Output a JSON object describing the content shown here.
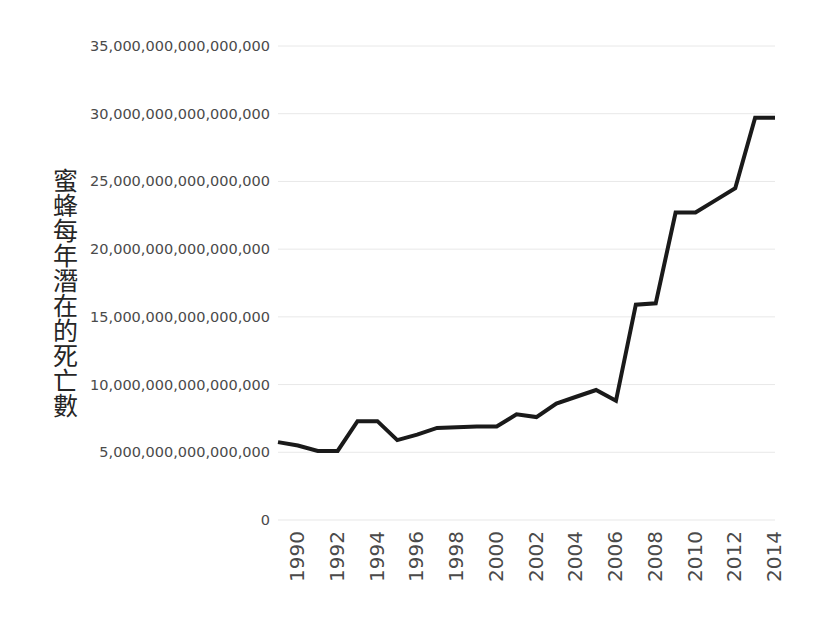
{
  "chart_data": {
    "type": "line",
    "title": "",
    "subtitle": "",
    "xlabel": "",
    "ylabel": "蜜蜂每年潛在的死亡數",
    "x": [
      1990,
      1991,
      1992,
      1993,
      1994,
      1995,
      1996,
      1997,
      1998,
      1999,
      2000,
      2001,
      2002,
      2003,
      2004,
      2005,
      2006,
      2007,
      2008,
      2009,
      2010,
      2011,
      2012,
      2013,
      2014,
      2015
    ],
    "values": [
      5750000000000000,
      5500000000000000,
      5100000000000000,
      5100000000000000,
      7300000000000000,
      7300000000000000,
      5900000000000000,
      6300000000000000,
      6800000000000000,
      6850000000000000,
      6900000000000000,
      6900000000000000,
      7800000000000000,
      7600000000000000,
      8600000000000000,
      9100000000000000,
      9600000000000000,
      8800000000000000,
      15900000000000000,
      16000000000000000,
      22700000000000000,
      22700000000000000,
      23600000000000000,
      24500000000000000,
      29700000000000000,
      29700000000000000
    ],
    "series": [
      {
        "name": "蜜蜂每年潛在的死亡數",
        "values": [
          5750000000000000,
          5500000000000000,
          5100000000000000,
          5100000000000000,
          7300000000000000,
          7300000000000000,
          5900000000000000,
          6300000000000000,
          6800000000000000,
          6850000000000000,
          6900000000000000,
          6900000000000000,
          7800000000000000,
          7600000000000000,
          8600000000000000,
          9100000000000000,
          9600000000000000,
          8800000000000000,
          15900000000000000,
          16000000000000000,
          22700000000000000,
          22700000000000000,
          23600000000000000,
          24500000000000000,
          29700000000000000,
          29700000000000000
        ],
        "color": "#1a1a1a"
      }
    ],
    "ylim": [
      0,
      35000000000000000
    ],
    "xlim": [
      1990,
      2015
    ],
    "y_ticks": [
      0,
      5000000000000000,
      10000000000000000,
      15000000000000000,
      20000000000000000,
      25000000000000000,
      30000000000000000,
      35000000000000000
    ],
    "y_tick_labels": [
      "0",
      "5,000,000,000,000,000",
      "10,000,000,000,000,000",
      "15,000,000,000,000,000",
      "20,000,000,000,000,000",
      "25,000,000,000,000,000",
      "30,000,000,000,000,000",
      "35,000,000,000,000,000"
    ],
    "x_tick_values": [
      1990,
      1992,
      1994,
      1996,
      1998,
      2000,
      2002,
      2004,
      2006,
      2008,
      2010,
      2012,
      2014
    ],
    "x_tick_labels": [
      "1990",
      "1992",
      "1994",
      "1996",
      "1998",
      "2000",
      "2002",
      "2004",
      "2006",
      "2008",
      "2010",
      "2012",
      "2014"
    ],
    "grid": {
      "horizontal": true,
      "vertical": false,
      "color": "#e8e8e8"
    },
    "legend": {
      "visible": false,
      "position": "none"
    },
    "markers": false,
    "line_width": 4,
    "background": "#ffffff",
    "axis_text_color": "#4a4a4a",
    "title_text_color": "#262626"
  }
}
